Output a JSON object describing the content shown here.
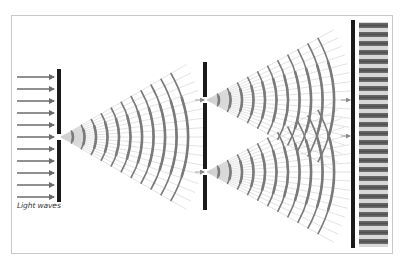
{
  "figure": {
    "caption": "Light waves"
  },
  "colors": {
    "background": "#ffffff",
    "frame": "#c9c9c9",
    "barrier": "#1a1a1a",
    "arrow": "#6b6b6b",
    "wavefront": "#7a7a7a",
    "ray": "#cfcfcf",
    "fan": "#e3e3e3",
    "fringe_dark": "#5a5a5a",
    "fringe_light": "#d8d8d8"
  },
  "incoming_arrows": {
    "count": 11,
    "x_start": 17,
    "x_end": 55,
    "y_first": 77,
    "spacing": 12
  },
  "barriers": [
    {
      "name": "single-slit-barrier",
      "x": 57,
      "width": 4,
      "y_top": 69,
      "y_bottom": 202,
      "slits": [
        137
      ]
    },
    {
      "name": "double-slit-barrier",
      "x": 203,
      "width": 4,
      "y_top": 62,
      "y_bottom": 210,
      "slits": [
        100,
        172
      ]
    },
    {
      "name": "screen-barrier",
      "x": 351,
      "width": 4,
      "y_top": 20,
      "y_bottom": 248,
      "slits": []
    }
  ],
  "wave_sources": [
    {
      "name": "single-slit-waves",
      "cx": 61,
      "cy": 137,
      "radius_first": 12,
      "radius_step": 11.5,
      "count": 11,
      "half_angle_deg": 30,
      "ray_length": 145
    },
    {
      "name": "upper-slit-waves",
      "cx": 207,
      "cy": 100,
      "radius_first": 12,
      "radius_step": 11.5,
      "count": 11,
      "half_angle_deg": 29,
      "ray_length": 145
    },
    {
      "name": "lower-slit-waves",
      "cx": 207,
      "cy": 172,
      "radius_first": 12,
      "radius_step": 11.5,
      "count": 11,
      "half_angle_deg": 29,
      "ray_length": 145
    }
  ],
  "interference_screen": {
    "x": 359,
    "y": 22,
    "width": 29,
    "height": 225,
    "fringe_period": 9
  }
}
